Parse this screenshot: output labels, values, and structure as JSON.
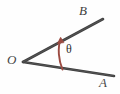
{
  "figure": {
    "type": "geometry-angle-diagram",
    "background_color": "#fefefe",
    "ink_color": "#3c3c3c",
    "arc_color": "#9c4b42",
    "labels": {
      "vertex": "O",
      "upper_ray_end": "B",
      "lower_ray_end": "A",
      "angle": "θ"
    },
    "geometry": {
      "vertex": {
        "x": 23,
        "y": 62
      },
      "rays": [
        {
          "name": "ray-OB",
          "from": {
            "x": 23,
            "y": 62
          },
          "to": {
            "x": 103,
            "y": 19
          },
          "label": "B"
        },
        {
          "name": "ray-OA",
          "from": {
            "x": 23,
            "y": 62
          },
          "to": {
            "x": 114,
            "y": 76
          },
          "label": "A"
        }
      ],
      "angle_arc": {
        "start": {
          "x": 62,
          "y": 69
        },
        "end": {
          "x": 60,
          "y": 38
        },
        "arrow_at": "end",
        "color": "#9c4b42"
      }
    }
  }
}
